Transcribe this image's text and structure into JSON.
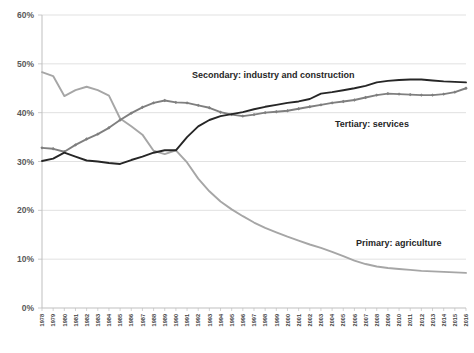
{
  "chart_data": {
    "type": "line",
    "title": "",
    "xlabel": "",
    "ylabel": "",
    "ylim": [
      0,
      60
    ],
    "yticks": [
      "0%",
      "10%",
      "20%",
      "30%",
      "40%",
      "50%",
      "60%"
    ],
    "ytick_values": [
      0,
      10,
      20,
      30,
      40,
      50,
      60
    ],
    "grid": "horizontal",
    "legend": "inline-annotations",
    "x": [
      1978,
      1979,
      1980,
      1981,
      1982,
      1983,
      1984,
      1985,
      1986,
      1987,
      1988,
      1989,
      1990,
      1991,
      1992,
      1993,
      1994,
      1995,
      1996,
      1997,
      1998,
      1999,
      2000,
      2001,
      2002,
      2003,
      2004,
      2005,
      2006,
      2007,
      2008,
      2009,
      2010,
      2011,
      2012,
      2013,
      2014,
      2015,
      2016
    ],
    "categories": [
      "1978",
      "1979",
      "1980",
      "1981",
      "1982",
      "1983",
      "1984",
      "1985",
      "1986",
      "1987",
      "1988",
      "1989",
      "1990",
      "1991",
      "1992",
      "1993",
      "1994",
      "1995",
      "1996",
      "1997",
      "1998",
      "1999",
      "2000",
      "2001",
      "2002",
      "2003",
      "2004",
      "2005",
      "2006",
      "2007",
      "2008",
      "2009",
      "2010",
      "2011",
      "2012",
      "2013",
      "2014",
      "2015",
      "2016"
    ],
    "series": [
      {
        "name": "Primary: agriculture",
        "color": "#a6a6a6",
        "marker": "none",
        "values": [
          48.3,
          47.5,
          43.4,
          44.6,
          45.3,
          44.6,
          43.5,
          38.8,
          37.2,
          35.5,
          32.2,
          31.5,
          32.3,
          29.8,
          26.5,
          23.9,
          21.8,
          20.2,
          18.8,
          17.5,
          16.4,
          15.5,
          14.6,
          13.8,
          13.0,
          12.3,
          11.5,
          10.6,
          9.7,
          9.0,
          8.5,
          8.2,
          8.0,
          7.8,
          7.6,
          7.5,
          7.4,
          7.3,
          7.2
        ]
      },
      {
        "name": "Tertiary: services",
        "color": "#7f7f7f",
        "marker": "diamond",
        "values": [
          32.8,
          32.6,
          32.0,
          33.4,
          34.6,
          35.6,
          36.9,
          38.5,
          39.9,
          41.1,
          42.0,
          42.5,
          42.1,
          42.0,
          41.5,
          41.0,
          40.1,
          39.6,
          39.3,
          39.6,
          40.0,
          40.2,
          40.4,
          40.8,
          41.2,
          41.6,
          42.0,
          42.3,
          42.6,
          43.1,
          43.6,
          43.9,
          43.8,
          43.7,
          43.6,
          43.6,
          43.8,
          44.2,
          45.0
        ]
      },
      {
        "name": "Secondary: industry and construction",
        "color": "#262626",
        "marker": "none",
        "values": [
          30.1,
          30.6,
          31.8,
          31.0,
          30.2,
          30.0,
          29.7,
          29.5,
          30.3,
          31.0,
          31.8,
          32.3,
          32.3,
          35.0,
          37.2,
          38.5,
          39.3,
          39.7,
          40.1,
          40.7,
          41.2,
          41.6,
          42.0,
          42.3,
          42.8,
          43.9,
          44.2,
          44.6,
          45.0,
          45.5,
          46.2,
          46.5,
          46.7,
          46.8,
          46.8,
          46.6,
          46.4,
          46.3,
          46.2
        ]
      }
    ],
    "annotations": [
      {
        "text": "Secondary: industry and construction",
        "x_px": 192,
        "y_px": 78
      },
      {
        "text": "Tertiary: services",
        "x_px": 335,
        "y_px": 127
      },
      {
        "text": "Primary: agriculture",
        "x_px": 356,
        "y_px": 246
      }
    ]
  },
  "axis": {
    "y_tick_labels": [
      "60%",
      "50%",
      "40%",
      "30%",
      "20%",
      "10%",
      "0%"
    ],
    "x_tick_labels": [
      "1978",
      "1979",
      "1980",
      "1981",
      "1982",
      "1983",
      "1984",
      "1985",
      "1986",
      "1987",
      "1988",
      "1989",
      "1990",
      "1991",
      "1992",
      "1993",
      "1994",
      "1995",
      "1996",
      "1997",
      "1998",
      "1999",
      "2000",
      "2001",
      "2002",
      "2003",
      "2004",
      "2005",
      "2006",
      "2007",
      "2008",
      "2009",
      "2010",
      "2011",
      "2012",
      "2013",
      "2014",
      "2015",
      "2016"
    ]
  },
  "colors": {
    "grid": "#d9d9d9",
    "axis": "#bfbfbf",
    "primary": "#a6a6a6",
    "tertiary": "#7f7f7f",
    "secondary": "#262626",
    "background": "#ffffff"
  }
}
